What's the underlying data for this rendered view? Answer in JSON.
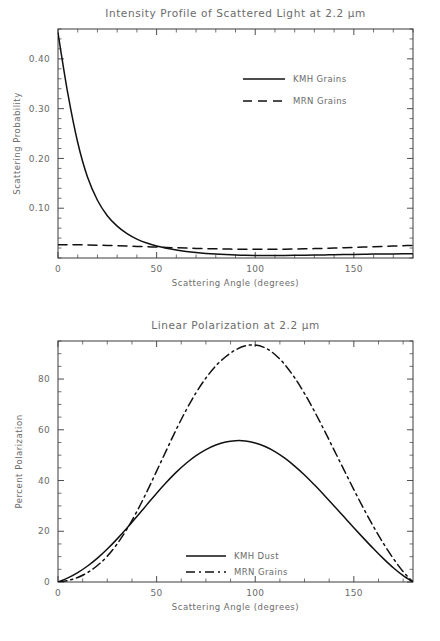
{
  "figure": {
    "width": 440,
    "height": 641,
    "background": "#ffffff",
    "ink_color": "#111111",
    "text_color": "#6b6b6b"
  },
  "chart_data": [
    {
      "type": "line",
      "id": "intensity-profile",
      "title": "Intensity Profile of Scattered Light at 2.2 μm",
      "xlabel": "Scattering Angle (degrees)",
      "ylabel": "Scattering Probability",
      "xlim": [
        0,
        180
      ],
      "ylim": [
        0,
        0.46
      ],
      "xticks": [
        0,
        50,
        100,
        150
      ],
      "xticklabels": [
        "0",
        "50",
        "100",
        "150"
      ],
      "yticks": [
        0.1,
        0.2,
        0.3,
        0.4
      ],
      "yticklabels": [
        "0.10",
        "0.20",
        "0.30",
        "0.40"
      ],
      "minor_ticks_per_interval": 5,
      "grid": false,
      "legend_position": "upper right",
      "x": [
        0,
        5,
        10,
        15,
        20,
        25,
        30,
        35,
        40,
        45,
        50,
        55,
        60,
        65,
        70,
        75,
        80,
        85,
        90,
        95,
        100,
        105,
        110,
        115,
        120,
        125,
        130,
        135,
        140,
        145,
        150,
        155,
        160,
        165,
        170,
        175,
        180
      ],
      "series": [
        {
          "name": "KMH Grains",
          "style": "solid",
          "values": [
            0.452,
            0.33,
            0.232,
            0.162,
            0.116,
            0.085,
            0.064,
            0.049,
            0.038,
            0.03,
            0.024,
            0.0195,
            0.016,
            0.0132,
            0.011,
            0.0092,
            0.0078,
            0.0068,
            0.006,
            0.0055,
            0.0052,
            0.005,
            0.005,
            0.0051,
            0.0053,
            0.0056,
            0.0059,
            0.0062,
            0.0066,
            0.0069,
            0.0072,
            0.0075,
            0.0078,
            0.008,
            0.0082,
            0.0083,
            0.0084
          ]
        },
        {
          "name": "MRN Grains",
          "style": "dashed",
          "values": [
            0.0268,
            0.0267,
            0.0265,
            0.0262,
            0.0258,
            0.0253,
            0.0247,
            0.024,
            0.0233,
            0.0226,
            0.0219,
            0.0212,
            0.0205,
            0.0199,
            0.0193,
            0.0188,
            0.0184,
            0.018,
            0.0177,
            0.0175,
            0.0174,
            0.0174,
            0.0175,
            0.0177,
            0.018,
            0.0184,
            0.0189,
            0.0194,
            0.02,
            0.0206,
            0.0213,
            0.022,
            0.0227,
            0.0234,
            0.0241,
            0.0247,
            0.0252
          ]
        }
      ]
    },
    {
      "type": "line",
      "id": "linear-polarization",
      "title": "Linear Polarization at 2.2 μm",
      "xlabel": "Scattering Angle (degrees)",
      "ylabel": "Percent Polarization",
      "xlim": [
        0,
        180
      ],
      "ylim": [
        0,
        95
      ],
      "xticks": [
        0,
        50,
        100,
        150
      ],
      "xticklabels": [
        "0",
        "50",
        "100",
        "150"
      ],
      "yticks": [
        0,
        20,
        40,
        60,
        80
      ],
      "yticklabels": [
        "0",
        "20",
        "40",
        "60",
        "80"
      ],
      "minor_ticks_per_interval": 4,
      "grid": false,
      "legend_position": "lower center",
      "x": [
        0,
        5,
        10,
        15,
        20,
        25,
        30,
        35,
        40,
        45,
        50,
        55,
        60,
        65,
        70,
        75,
        80,
        85,
        90,
        95,
        100,
        105,
        110,
        115,
        120,
        125,
        130,
        135,
        140,
        145,
        150,
        155,
        160,
        165,
        170,
        175,
        180
      ],
      "series": [
        {
          "name": "KMH Dust",
          "style": "solid",
          "values": [
            0.0,
            1.6,
            3.7,
            6.3,
            9.4,
            13.0,
            17.0,
            21.3,
            25.8,
            30.4,
            35.0,
            39.3,
            43.3,
            46.8,
            49.8,
            52.2,
            54.0,
            55.2,
            55.7,
            55.6,
            54.8,
            53.4,
            51.4,
            48.8,
            45.7,
            42.2,
            38.3,
            34.2,
            30.0,
            25.7,
            21.4,
            17.2,
            13.1,
            9.2,
            5.6,
            2.5,
            0.0
          ]
        },
        {
          "name": "MRN Grains",
          "style": "dash-dot",
          "values": [
            0.0,
            0.6,
            1.8,
            3.7,
            6.5,
            10.2,
            15.0,
            20.9,
            27.8,
            35.5,
            43.7,
            52.0,
            60.2,
            67.8,
            74.6,
            80.4,
            85.2,
            88.8,
            91.5,
            93.1,
            93.4,
            92.3,
            89.7,
            85.7,
            80.5,
            74.3,
            67.3,
            59.8,
            52.0,
            44.2,
            36.4,
            28.9,
            21.8,
            15.2,
            9.3,
            4.1,
            0.0
          ]
        }
      ]
    }
  ]
}
